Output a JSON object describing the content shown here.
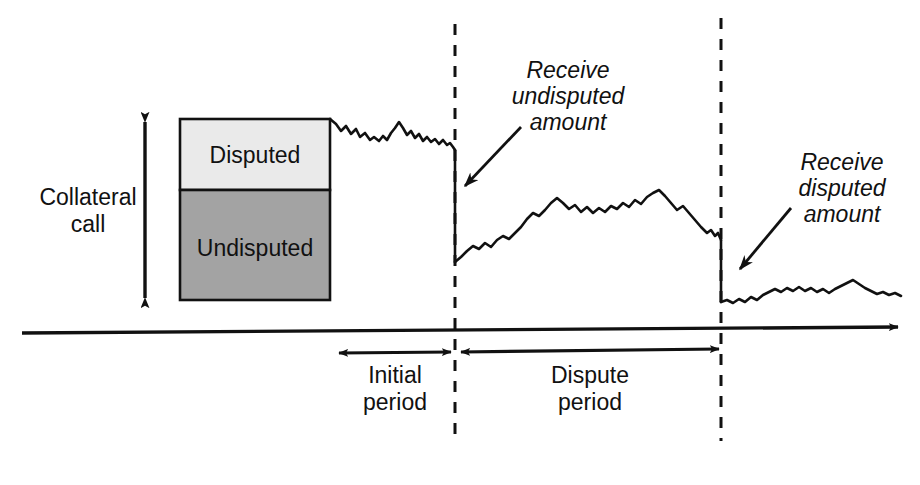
{
  "diagram": {
    "background_color": "#ffffff",
    "line_color": "#111111"
  },
  "collateral_bar": {
    "bracket_label_line1": "Collateral",
    "bracket_label_line2": "call",
    "bracket_label": "Collateral call",
    "segments": [
      {
        "name": "disputed",
        "label": "Disputed",
        "fill_color": "#eaeaea",
        "top": 119,
        "bottom": 190
      },
      {
        "name": "undisputed",
        "label": "Undisputed",
        "fill_color": "#a3a3a3",
        "top": 190,
        "bottom": 300
      }
    ],
    "box_left": 180,
    "box_right": 330,
    "box_top": 119,
    "box_bottom": 300
  },
  "annotations": [
    {
      "name": "receive-undisputed",
      "line1": "Receive",
      "line2": "undisputed",
      "line3": "amount",
      "text": "Receive undisputed amount",
      "text_center_x": 568,
      "arrow_from": [
        521,
        127
      ],
      "arrow_to": [
        462,
        189
      ]
    },
    {
      "name": "receive-disputed",
      "line1": "Receive",
      "line2": "disputed",
      "line3": "amount",
      "text": "Receive disputed amount",
      "text_center_x": 842,
      "arrow_from": [
        791,
        208
      ],
      "arrow_to": [
        737,
        272
      ]
    }
  ],
  "periods": [
    {
      "name": "initial-period",
      "line1": "Initial",
      "line2": "period",
      "label": "Initial period",
      "start_x": 337,
      "end_x": 452,
      "center_x": 395
    },
    {
      "name": "dispute-period",
      "line1": "Dispute",
      "line2": "period",
      "label": "Dispute period",
      "start_x": 459,
      "end_x": 720,
      "center_x": 590
    }
  ],
  "event_lines": [
    {
      "name": "initial-period-end",
      "x": 455,
      "top": 24,
      "bottom": 441,
      "style": "dashed"
    },
    {
      "name": "dispute-period-end",
      "x": 721,
      "top": 18,
      "bottom": 441,
      "style": "dashed"
    }
  ],
  "time_axis": {
    "name": "time-axis",
    "from_x": 22,
    "to_x": 903,
    "y_left": 333,
    "y_right": 327,
    "arrow": "right"
  },
  "exposure_path": {
    "type": "line",
    "description": "Mark-to-market exposure over time with two step-downs at collateral receipt events",
    "segments": [
      {
        "name": "initial-period-path",
        "points": [
          [
            330,
            119
          ],
          [
            336,
            124
          ],
          [
            341,
            131
          ],
          [
            346,
            126
          ],
          [
            351,
            134
          ],
          [
            356,
            129
          ],
          [
            360,
            137
          ],
          [
            365,
            133
          ],
          [
            370,
            140
          ],
          [
            374,
            137
          ],
          [
            379,
            141
          ],
          [
            383,
            136
          ],
          [
            387,
            140
          ],
          [
            391,
            133
          ],
          [
            395,
            128
          ],
          [
            399,
            122
          ],
          [
            403,
            128
          ],
          [
            407,
            135
          ],
          [
            411,
            131
          ],
          [
            415,
            138
          ],
          [
            419,
            134
          ],
          [
            423,
            141
          ],
          [
            427,
            137
          ],
          [
            431,
            142
          ],
          [
            435,
            139
          ],
          [
            439,
            144
          ],
          [
            443,
            140
          ],
          [
            447,
            145
          ],
          [
            450,
            143
          ],
          [
            453,
            147
          ],
          [
            455,
            150
          ]
        ]
      },
      {
        "name": "first-step-down",
        "points": [
          [
            455,
            150
          ],
          [
            455,
            262
          ]
        ]
      },
      {
        "name": "dispute-period-path",
        "points": [
          [
            455,
            262
          ],
          [
            461,
            257
          ],
          [
            467,
            251
          ],
          [
            473,
            246
          ],
          [
            479,
            249
          ],
          [
            485,
            243
          ],
          [
            491,
            247
          ],
          [
            497,
            240
          ],
          [
            503,
            236
          ],
          [
            509,
            239
          ],
          [
            515,
            233
          ],
          [
            521,
            227
          ],
          [
            527,
            219
          ],
          [
            533,
            213
          ],
          [
            539,
            216
          ],
          [
            545,
            210
          ],
          [
            551,
            203
          ],
          [
            557,
            198
          ],
          [
            563,
            203
          ],
          [
            569,
            209
          ],
          [
            575,
            205
          ],
          [
            581,
            212
          ],
          [
            587,
            207
          ],
          [
            593,
            213
          ],
          [
            599,
            208
          ],
          [
            605,
            212
          ],
          [
            611,
            206
          ],
          [
            617,
            209
          ],
          [
            623,
            203
          ],
          [
            629,
            207
          ],
          [
            635,
            200
          ],
          [
            641,
            204
          ],
          [
            647,
            197
          ],
          [
            653,
            193
          ],
          [
            659,
            190
          ],
          [
            665,
            196
          ],
          [
            671,
            203
          ],
          [
            677,
            210
          ],
          [
            683,
            206
          ],
          [
            689,
            213
          ],
          [
            695,
            220
          ],
          [
            701,
            227
          ],
          [
            707,
            233
          ],
          [
            711,
            230
          ],
          [
            715,
            236
          ],
          [
            718,
            233
          ],
          [
            721,
            240
          ]
        ]
      },
      {
        "name": "second-step-down",
        "points": [
          [
            721,
            240
          ],
          [
            721,
            302
          ]
        ]
      },
      {
        "name": "post-dispute-path",
        "points": [
          [
            721,
            302
          ],
          [
            727,
            300
          ],
          [
            733,
            303
          ],
          [
            739,
            299
          ],
          [
            745,
            302
          ],
          [
            751,
            297
          ],
          [
            757,
            300
          ],
          [
            763,
            295
          ],
          [
            769,
            292
          ],
          [
            775,
            289
          ],
          [
            781,
            292
          ],
          [
            787,
            288
          ],
          [
            793,
            291
          ],
          [
            799,
            287
          ],
          [
            805,
            291
          ],
          [
            811,
            288
          ],
          [
            817,
            292
          ],
          [
            823,
            289
          ],
          [
            829,
            293
          ],
          [
            835,
            289
          ],
          [
            841,
            286
          ],
          [
            847,
            283
          ],
          [
            853,
            280
          ],
          [
            859,
            284
          ],
          [
            865,
            288
          ],
          [
            871,
            291
          ],
          [
            877,
            294
          ],
          [
            883,
            292
          ],
          [
            889,
            295
          ],
          [
            895,
            293
          ],
          [
            901,
            296
          ]
        ]
      }
    ]
  }
}
